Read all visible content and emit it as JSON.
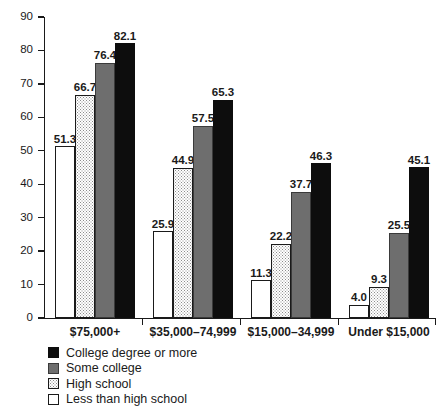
{
  "chart_data": {
    "type": "bar",
    "title": "",
    "xlabel": "",
    "ylabel": "",
    "ylim": [
      0,
      90
    ],
    "ytick_step": 10,
    "grid": false,
    "legend_position": "bottom-left",
    "categories": [
      "$75,000+",
      "$35,000–74,999",
      "$15,000–34,999",
      "Under $15,000"
    ],
    "ytick_labels": [
      "0",
      "10",
      "20",
      "30",
      "40",
      "50",
      "60",
      "70",
      "80",
      "90"
    ],
    "series": [
      {
        "name": "Less than high school",
        "style": "white",
        "color": "#ffffff",
        "values": [
          51.3,
          25.9,
          11.3,
          4.0
        ],
        "labels": [
          "51.3",
          "25.9",
          "11.3",
          "4.0"
        ]
      },
      {
        "name": "High school",
        "style": "dots",
        "color": "#ffffff",
        "values": [
          66.7,
          44.9,
          22.2,
          9.3
        ],
        "labels": [
          "66.7",
          "44.9",
          "22.2",
          "9.3"
        ]
      },
      {
        "name": "Some college",
        "style": "gray",
        "color": "#6e6e6e",
        "values": [
          76.4,
          57.5,
          37.7,
          25.5
        ],
        "labels": [
          "76.4",
          "57.5",
          "37.7",
          "25.5"
        ]
      },
      {
        "name": "College degree or more",
        "style": "dark",
        "color": "#0d0d0d",
        "values": [
          82.1,
          65.3,
          46.3,
          45.1
        ],
        "labels": [
          "82.1",
          "65.3",
          "46.3",
          "45.1"
        ]
      }
    ],
    "legend": [
      {
        "label": "College degree or more",
        "style": "dark"
      },
      {
        "label": "Some college",
        "style": "gray"
      },
      {
        "label": "High school",
        "style": "dots"
      },
      {
        "label": "Less than high school",
        "style": "white"
      }
    ]
  }
}
